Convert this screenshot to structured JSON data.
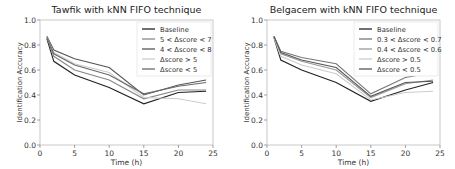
{
  "chart_data": [
    {
      "type": "line",
      "title": "Tawfik with kNN FIFO technique",
      "xlabel": "Time (h)",
      "ylabel": "Identification Accuracy",
      "xlim": [
        0,
        25
      ],
      "ylim": [
        0.0,
        1.0
      ],
      "xticks": [
        "0",
        "5",
        "10",
        "15",
        "20",
        "25"
      ],
      "yticks": [
        "0.0",
        "0.2",
        "0.4",
        "0.6",
        "0.8",
        "1.0"
      ],
      "grid": false,
      "legend_position": "upper right",
      "x": [
        1,
        2,
        5,
        10,
        15,
        20,
        24
      ],
      "series": [
        {
          "name": "Baseline",
          "color": "#222222",
          "values": [
            0.85,
            0.67,
            0.56,
            0.46,
            0.33,
            0.42,
            0.43
          ]
        },
        {
          "name": "5 < Δscore < 7",
          "color": "#888888",
          "values": [
            0.86,
            0.71,
            0.6,
            0.52,
            0.37,
            0.44,
            0.44
          ]
        },
        {
          "name": "4 < Δscore < 8",
          "color": "#555555",
          "values": [
            0.87,
            0.76,
            0.69,
            0.62,
            0.4,
            0.48,
            0.52
          ]
        },
        {
          "name": "Δscore > 5",
          "color": "#cccccc",
          "values": [
            0.86,
            0.74,
            0.65,
            0.58,
            0.38,
            0.37,
            0.33
          ]
        },
        {
          "name": "Δscore < 5",
          "color": "#6a6a6a",
          "values": [
            0.86,
            0.73,
            0.64,
            0.56,
            0.41,
            0.47,
            0.5
          ]
        }
      ]
    },
    {
      "type": "line",
      "title": "Belgacem with kNN FIFO technique",
      "xlabel": "Time (h)",
      "ylabel": "Identification Accuracy",
      "xlim": [
        0,
        25
      ],
      "ylim": [
        0.0,
        1.0
      ],
      "xticks": [
        "0",
        "5",
        "10",
        "15",
        "20",
        "25"
      ],
      "yticks": [
        "0.0",
        "0.2",
        "0.4",
        "0.6",
        "0.8",
        "1.0"
      ],
      "grid": false,
      "legend_position": "upper right",
      "x": [
        1,
        2,
        5,
        10,
        15,
        20,
        24
      ],
      "series": [
        {
          "name": "Baseline",
          "color": "#222222",
          "values": [
            0.86,
            0.68,
            0.6,
            0.5,
            0.35,
            0.44,
            0.5
          ]
        },
        {
          "name": "0.3 < Δscore < 0.7",
          "color": "#777777",
          "values": [
            0.87,
            0.75,
            0.7,
            0.65,
            0.41,
            0.54,
            0.58
          ]
        },
        {
          "name": "0.4 < Δscore < 0.6",
          "color": "#999999",
          "values": [
            0.87,
            0.73,
            0.67,
            0.6,
            0.38,
            0.49,
            0.52
          ]
        },
        {
          "name": "Δscore > 0.5",
          "color": "#cccccc",
          "values": [
            0.86,
            0.71,
            0.64,
            0.57,
            0.36,
            0.42,
            0.43
          ]
        },
        {
          "name": "Δscore < 0.5",
          "color": "#555555",
          "values": [
            0.87,
            0.74,
            0.68,
            0.62,
            0.39,
            0.5,
            0.51
          ]
        }
      ]
    }
  ]
}
